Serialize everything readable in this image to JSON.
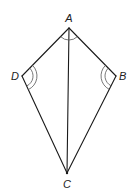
{
  "diagram": {
    "type": "kite",
    "colors": {
      "stroke": "#1a1a1a",
      "arc": "#555555",
      "label": "#222222",
      "background": "#ffffff"
    },
    "vertices": {
      "A": {
        "label": "A",
        "x": 69,
        "y": 28
      },
      "B": {
        "label": "B",
        "x": 116,
        "y": 76
      },
      "C": {
        "label": "C",
        "x": 67,
        "y": 173
      },
      "D": {
        "label": "D",
        "x": 22,
        "y": 76
      }
    },
    "edges": [
      [
        "A",
        "B"
      ],
      [
        "B",
        "C"
      ],
      [
        "C",
        "D"
      ],
      [
        "D",
        "A"
      ],
      [
        "A",
        "C"
      ]
    ],
    "angle_marks": [
      {
        "vertex": "A",
        "arcs": 1
      },
      {
        "vertex": "B",
        "arcs": 2
      },
      {
        "vertex": "D",
        "arcs": 2
      }
    ]
  }
}
